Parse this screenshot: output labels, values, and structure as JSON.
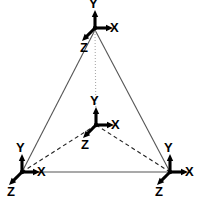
{
  "figure": {
    "background_color": "#ffffff",
    "width": 201,
    "height": 201,
    "edge_color": "#555555",
    "hidden_edge_color": "#222222",
    "vertical_edge_color": "#aaaaaa",
    "axis_color": "#000000",
    "label_color": "#000000"
  },
  "vertices": [
    {
      "id": "apex",
      "name": "top-vertex",
      "x": 95,
      "y": 30
    },
    {
      "id": "bottom_left",
      "name": "bottom-left-vertex",
      "x": 22,
      "y": 172
    },
    {
      "id": "bottom_right",
      "name": "bottom-right-vertex",
      "x": 170,
      "y": 172
    },
    {
      "id": "center",
      "name": "center-vertex",
      "x": 96,
      "y": 125
    }
  ],
  "edges": [
    {
      "name": "edge-apex-bottom-left",
      "from": "apex",
      "to": "bottom_left",
      "style": "solid",
      "color": "#555555",
      "width": 1.1
    },
    {
      "name": "edge-apex-bottom-right",
      "from": "apex",
      "to": "bottom_right",
      "style": "solid",
      "color": "#555555",
      "width": 1.1
    },
    {
      "name": "edge-bottom-left-bottom-right",
      "from": "bottom_left",
      "to": "bottom_right",
      "style": "solid",
      "color": "#555555",
      "width": 1.1
    },
    {
      "name": "edge-center-bottom-left",
      "from": "center",
      "to": "bottom_left",
      "style": "dashed",
      "color": "#222222",
      "width": 1.1
    },
    {
      "name": "edge-center-bottom-right",
      "from": "center",
      "to": "bottom_right",
      "style": "dashed",
      "color": "#222222",
      "width": 1.1
    },
    {
      "name": "edge-center-apex",
      "from": "center",
      "to": "apex",
      "style": "dotted",
      "color": "#aaaaaa",
      "width": 1.1
    }
  ],
  "frames": [
    {
      "id": "frame_top",
      "name": "coordinate-frame-top",
      "origin": {
        "x": 95,
        "y": 28
      },
      "axes": {
        "y": {
          "label": "Y",
          "dx": 0,
          "dy": -18,
          "label_x": 89,
          "label_y": 8
        },
        "x": {
          "label": "X",
          "dx": 18,
          "dy": 0,
          "label_x": 110,
          "label_y": 32
        },
        "z": {
          "label": "Z",
          "dx": -13,
          "dy": 13,
          "label_x": 80,
          "label_y": 52
        }
      }
    },
    {
      "id": "frame_center",
      "name": "coordinate-frame-center",
      "origin": {
        "x": 96,
        "y": 125
      },
      "axes": {
        "y": {
          "label": "Y",
          "dx": 0,
          "dy": -18,
          "label_x": 90,
          "label_y": 105
        },
        "x": {
          "label": "X",
          "dx": 18,
          "dy": 0,
          "label_x": 111,
          "label_y": 129
        },
        "z": {
          "label": "Z",
          "dx": -13,
          "dy": 13,
          "label_x": 81,
          "label_y": 149
        }
      }
    },
    {
      "id": "frame_bottom_left",
      "name": "coordinate-frame-bottom-left",
      "origin": {
        "x": 22,
        "y": 172
      },
      "axes": {
        "y": {
          "label": "Y",
          "dx": 0,
          "dy": -18,
          "label_x": 16,
          "label_y": 152
        },
        "x": {
          "label": "X",
          "dx": 18,
          "dy": 0,
          "label_x": 37,
          "label_y": 176
        },
        "z": {
          "label": "Z",
          "dx": -13,
          "dy": 13,
          "label_x": 7,
          "label_y": 196
        }
      }
    },
    {
      "id": "frame_bottom_right",
      "name": "coordinate-frame-bottom-right",
      "origin": {
        "x": 170,
        "y": 172
      },
      "axes": {
        "y": {
          "label": "Y",
          "dx": 0,
          "dy": -18,
          "label_x": 164,
          "label_y": 152
        },
        "x": {
          "label": "X",
          "dx": 18,
          "dy": 0,
          "label_x": 185,
          "label_y": 176
        },
        "z": {
          "label": "Z",
          "dx": -13,
          "dy": 13,
          "label_x": 155,
          "label_y": 196
        }
      }
    }
  ]
}
